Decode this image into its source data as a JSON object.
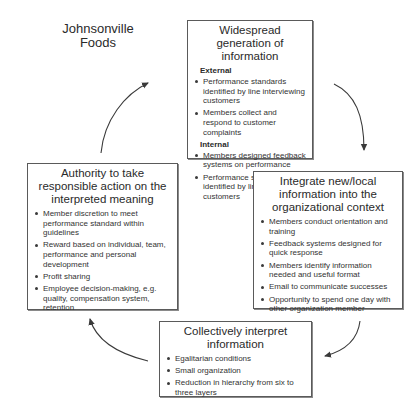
{
  "diagram": {
    "title": "Johnsonville Foods",
    "title_lines": [
      "Johnsonville",
      "Foods"
    ],
    "boxes": {
      "top": {
        "title": "Widespread generation of information",
        "sections": [
          {
            "label": "External",
            "items": [
              "Performance standards identified by line interviewing customers",
              "Members collect and respond to customer complaints"
            ]
          },
          {
            "label": "Internal",
            "items": [
              "Members designed feedback systems on performance",
              "Performance standards identified by line interviewing customers"
            ]
          }
        ]
      },
      "right": {
        "title": "Integrate new/local information into the organizational context",
        "items": [
          "Members conduct orientation and training",
          "Feedback systems designed for quick response",
          "Members identify information needed and useful format",
          "Email to communicate successes",
          "Opportunity to spend one day with other organization member"
        ]
      },
      "bottom": {
        "title": "Collectively interpret information",
        "items": [
          "Egalitarian conditions",
          "Small organization",
          "Reduction in hierarchy from six to three layers"
        ]
      },
      "left": {
        "title": "Authority to take responsible action on the interpreted meaning",
        "items": [
          "Member discretion to meet performance standard within guidelines",
          "Reward based on individual, team, performance and personal development",
          "Profit sharing",
          "Employee decision-making, e.g. quality, compensation system, retention"
        ]
      }
    },
    "flow": [
      "Widespread generation of information",
      "Integrate new/local information into the organizational context",
      "Collectively interpret information",
      "Authority to take responsible action on the interpreted meaning"
    ],
    "colors": {
      "line": "#3a3a3a",
      "text": "#2a2a2a",
      "background": "#ffffff"
    }
  }
}
